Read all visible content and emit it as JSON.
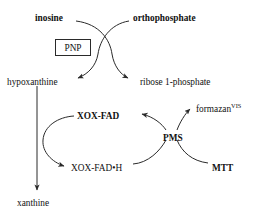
{
  "diagram": {
    "type": "biochemical-reaction-scheme",
    "stroke_color": "#2a2a2a",
    "text_color": "#111111",
    "background_color": "#ffffff",
    "enzyme": {
      "name": "PNP",
      "boxed": true
    },
    "nodes": {
      "inosine": {
        "label": "inosine",
        "bold": true,
        "x": 35,
        "y": 14
      },
      "orthophosphate": {
        "label": "orthophosphate",
        "bold": true,
        "x": 133,
        "y": 14
      },
      "hypoxanthine": {
        "label": "hypoxanthine",
        "bold": false,
        "x": 7,
        "y": 78
      },
      "ribose_1_phosphate": {
        "label": "ribose 1-phosphate",
        "bold": false,
        "x": 140,
        "y": 78
      },
      "xox_fad": {
        "label": "XOX-FAD",
        "bold": true,
        "x": 77,
        "y": 112
      },
      "xox_fad_h": {
        "label": "XOX-FAD•H",
        "bold": false,
        "x": 71,
        "y": 164
      },
      "pms": {
        "label": "PMS",
        "bold": true,
        "x": 163,
        "y": 134
      },
      "formazan": {
        "label": "formazan",
        "superscript": "VIS",
        "bold": false,
        "x": 196,
        "y": 105
      },
      "mtt": {
        "label": "MTT",
        "bold": true,
        "x": 212,
        "y": 164
      },
      "xanthine": {
        "label": "xanthine",
        "bold": false,
        "x": 17,
        "y": 199
      }
    },
    "edges": [
      {
        "name": "inosine-to-ribose-1-phosphate",
        "from": "inosine",
        "to": "ribose_1_phosphate",
        "arrow": true
      },
      {
        "name": "orthophosphate-to-hypoxanthine",
        "from": "orthophosphate",
        "to": "hypoxanthine",
        "arrow": true
      },
      {
        "name": "hypoxanthine-to-xanthine",
        "from": "hypoxanthine",
        "to": "xanthine",
        "arrow": true
      },
      {
        "name": "xox-fad-to-xox-fad-h",
        "from": "xox_fad",
        "to": "xox_fad_h",
        "arrow": true
      },
      {
        "name": "pms-to-xox-fad",
        "from": "pms",
        "to": "xox_fad",
        "arrow": true
      },
      {
        "name": "xox-fad-h-to-pms",
        "from": "xox_fad_h",
        "to": "pms",
        "arrow": false
      },
      {
        "name": "pms-to-formazan",
        "from": "pms",
        "to": "formazan",
        "arrow": true
      },
      {
        "name": "mtt-to-pms",
        "from": "mtt",
        "to": "pms",
        "arrow": false
      }
    ]
  }
}
